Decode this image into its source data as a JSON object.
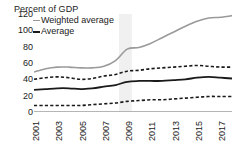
{
  "chart_data": {
    "type": "line",
    "title": "Percent of GDP",
    "xlabel": "",
    "ylabel": "Percent of GDP",
    "ylim": [
      0,
      120
    ],
    "yticks": [
      0,
      20,
      40,
      60,
      80,
      100,
      120
    ],
    "xlim": [
      2001,
      2018
    ],
    "grid": false,
    "legend_position": "top-left",
    "x": [
      2001,
      2002,
      2003,
      2004,
      2005,
      2006,
      2007,
      2008,
      2009,
      2010,
      2011,
      2012,
      2013,
      2014,
      2015,
      2016,
      2017,
      2018
    ],
    "xticks": [
      2001,
      2003,
      2005,
      2007,
      2009,
      2011,
      2013,
      2015,
      2017
    ],
    "xticklabels": [
      "2001",
      "2003",
      "2005",
      "2007",
      "2009",
      "2011",
      "2013",
      "2015",
      "2017"
    ],
    "series": [
      {
        "name": "Weighted average",
        "style": "solid",
        "color": "#9a9a9a",
        "values": [
          49,
          53,
          55,
          55,
          54,
          54,
          56,
          63,
          77,
          79,
          84,
          91,
          98,
          105,
          111,
          115,
          116,
          118
        ]
      },
      {
        "name": "Upper band",
        "style": "dashed",
        "color": "#1a1a1a",
        "values": [
          40,
          42,
          43,
          42,
          40,
          41,
          44,
          46,
          50,
          51,
          53,
          54,
          55,
          56,
          57,
          56,
          55,
          55
        ]
      },
      {
        "name": "Average",
        "style": "solid",
        "color": "#1a1a1a",
        "values": [
          27,
          28,
          29,
          29,
          28,
          29,
          31,
          33,
          37,
          38,
          38,
          38,
          39,
          40,
          42,
          43,
          42,
          41
        ]
      },
      {
        "name": "Lower band",
        "style": "dashed",
        "color": "#1a1a1a",
        "values": [
          8,
          8,
          8,
          8,
          8,
          9,
          10,
          11,
          13,
          14,
          15,
          15,
          16,
          17,
          18,
          19,
          19,
          19
        ]
      }
    ],
    "shaded_band": {
      "start": 2008.3,
      "end": 2009.4,
      "color": "#f0f0f0"
    },
    "legend": [
      {
        "label": "Weighted average",
        "style": "solid",
        "color": "#9a9a9a"
      },
      {
        "label": "Average",
        "style": "solid",
        "color": "#1a1a1a"
      }
    ]
  }
}
